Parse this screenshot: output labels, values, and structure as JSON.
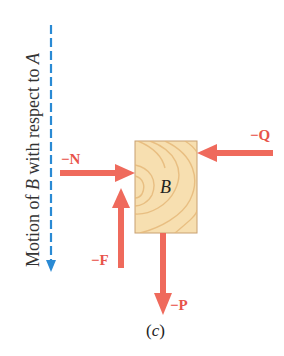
{
  "figure": {
    "caption": "(c)",
    "caption_letter": "c",
    "motion_label": {
      "prefix": "Motion of ",
      "body": "B",
      "middle": " with respect to ",
      "ref": "A"
    },
    "block_label": "B",
    "forces": [
      {
        "name": "N",
        "label": "−N",
        "direction": "right"
      },
      {
        "name": "Q",
        "label": "−Q",
        "direction": "left"
      },
      {
        "name": "F",
        "label": "−F",
        "direction": "up"
      },
      {
        "name": "P",
        "label": "−P",
        "direction": "down"
      }
    ],
    "colors": {
      "force_arrow": "#ef6a5c",
      "force_label": "#e8534a",
      "motion_line": "#2a8ad4",
      "block_fill": "#f7dfb0",
      "block_grain": "#e6b97a",
      "block_border": "#c8a070"
    }
  }
}
